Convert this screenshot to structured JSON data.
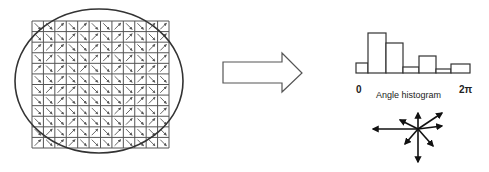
{
  "diagram": {
    "grid": {
      "cols": 12,
      "rows": 12,
      "x": 32,
      "y": 21,
      "width": 137,
      "height": 127,
      "stroke": "#555555",
      "arrow_color": "#555555",
      "angles_deg": [
        [
          315,
          315,
          45,
          315,
          45,
          315,
          315,
          45,
          315,
          315,
          45,
          45
        ],
        [
          315,
          315,
          315,
          45,
          315,
          45,
          315,
          45,
          45,
          315,
          315,
          45
        ],
        [
          45,
          45,
          45,
          315,
          315,
          45,
          315,
          45,
          315,
          315,
          45,
          45
        ],
        [
          315,
          45,
          315,
          315,
          315,
          45,
          45,
          315,
          45,
          315,
          315,
          45
        ],
        [
          45,
          315,
          45,
          315,
          45,
          315,
          315,
          45,
          315,
          45,
          45,
          45
        ],
        [
          315,
          315,
          45,
          315,
          315,
          315,
          315,
          315,
          315,
          45,
          315,
          315
        ],
        [
          315,
          45,
          45,
          45,
          315,
          315,
          315,
          315,
          315,
          45,
          315,
          45
        ],
        [
          315,
          315,
          45,
          315,
          315,
          315,
          315,
          315,
          45,
          45,
          45,
          315
        ],
        [
          315,
          315,
          315,
          315,
          315,
          315,
          315,
          45,
          45,
          315,
          315,
          45
        ],
        [
          315,
          315,
          315,
          45,
          315,
          315,
          315,
          315,
          45,
          315,
          45,
          315
        ],
        [
          315,
          45,
          315,
          45,
          315,
          45,
          315,
          45,
          315,
          315,
          315,
          315
        ],
        [
          45,
          315,
          45,
          45,
          315,
          315,
          315,
          45,
          315,
          315,
          315,
          315
        ]
      ]
    },
    "ellipse": {
      "cx": 99,
      "cy": 81,
      "rx": 84,
      "ry": 72,
      "stroke": "#333333"
    },
    "arrow_shape": {
      "label": "block-arrow-right",
      "stroke": "#555555"
    },
    "histogram": {
      "label": "Angle histogram",
      "x_min_label": "0",
      "x_max_label": "2π",
      "baseline_y": 73,
      "bars": [
        {
          "x0": 356,
          "x1": 368,
          "top": 63
        },
        {
          "x0": 368,
          "x1": 386,
          "top": 33
        },
        {
          "x0": 386,
          "x1": 403,
          "top": 43
        },
        {
          "x0": 403,
          "x1": 419,
          "top": 67
        },
        {
          "x0": 419,
          "x1": 436,
          "top": 56
        },
        {
          "x0": 436,
          "x1": 451,
          "top": 69
        },
        {
          "x0": 451,
          "x1": 470,
          "top": 64
        }
      ],
      "stroke": "#333333"
    },
    "descriptor": {
      "label": "orientation-descriptor",
      "center": [
        418,
        129
      ],
      "vectors": [
        {
          "dx": -45,
          "dy": 0
        },
        {
          "dx": 0,
          "dy": -16
        },
        {
          "dx": 0,
          "dy": 33
        },
        {
          "dx": 24,
          "dy": -16
        },
        {
          "dx": 24,
          "dy": -3
        },
        {
          "dx": -18,
          "dy": -9
        },
        {
          "dx": -13,
          "dy": 15
        },
        {
          "dx": 15,
          "dy": 17
        }
      ],
      "stroke": "#111111"
    }
  }
}
